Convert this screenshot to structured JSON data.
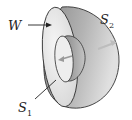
{
  "diagram": {
    "labels": {
      "region": {
        "text": "W"
      },
      "outer_surface": {
        "base": "S",
        "sub": "2"
      },
      "inner_surface": {
        "base": "S",
        "sub": "1"
      }
    },
    "colors": {
      "outer_shell_dark": "#6f6f6f",
      "outer_shell_light": "#d9d9d9",
      "rim_face": "#ececec",
      "inner_shell": "#9a9a9a",
      "outline": "#333333",
      "normal_arrow": "#bdbdbd"
    }
  }
}
